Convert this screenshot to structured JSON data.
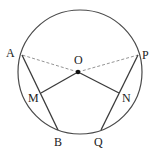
{
  "diagram": {
    "points": {
      "A": {
        "label": "A"
      },
      "B": {
        "label": "B"
      },
      "P": {
        "label": "P"
      },
      "Q": {
        "label": "Q"
      },
      "M": {
        "label": "M"
      },
      "N": {
        "label": "N"
      },
      "O": {
        "label": "O"
      }
    },
    "segments": [
      {
        "from": "A",
        "to": "B",
        "style": "solid"
      },
      {
        "from": "P",
        "to": "Q",
        "style": "solid"
      },
      {
        "from": "O",
        "to": "M",
        "style": "solid"
      },
      {
        "from": "O",
        "to": "N",
        "style": "solid"
      },
      {
        "from": "O",
        "to": "A",
        "style": "dashed"
      },
      {
        "from": "O",
        "to": "P",
        "style": "dashed"
      }
    ],
    "colors": {
      "stroke": "#3a3a3a",
      "dashed": "#888888",
      "text": "#222222",
      "background": "#ffffff"
    }
  }
}
